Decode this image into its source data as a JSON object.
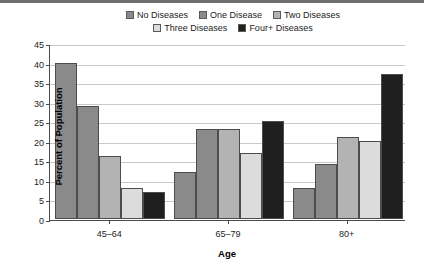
{
  "chart_data": {
    "type": "bar",
    "title": "",
    "xlabel": "Age",
    "ylabel": "Percent of Population",
    "categories": [
      "45–64",
      "65–79",
      "80+"
    ],
    "ylim": [
      0,
      45
    ],
    "ytick_labels": [
      "0",
      "5",
      "10",
      "15",
      "20",
      "25",
      "30",
      "35",
      "40",
      "45"
    ],
    "ytick_values": [
      0,
      5,
      10,
      15,
      20,
      25,
      30,
      35,
      40,
      45
    ],
    "grid": true,
    "legend_position": "top",
    "series": [
      {
        "name": "No Diseases",
        "color": "#8a8a8a",
        "values": [
          40,
          12,
          8
        ]
      },
      {
        "name": "One Disease",
        "color": "#8a8a8a",
        "values": [
          29,
          23,
          14
        ]
      },
      {
        "name": "Two Diseases",
        "color": "#b3b3b3",
        "values": [
          16,
          23,
          21
        ]
      },
      {
        "name": "Three Diseases",
        "color": "#dcdcdc",
        "values": [
          8,
          17,
          20
        ]
      },
      {
        "name": "Four+ Diseases",
        "color": "#1f1f1f",
        "values": [
          7,
          25,
          37
        ]
      }
    ]
  }
}
